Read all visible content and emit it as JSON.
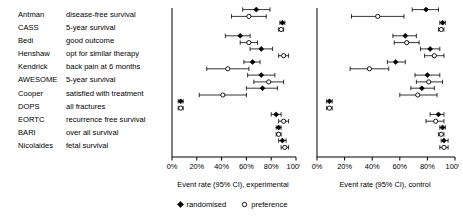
{
  "figure": {
    "legend": [
      {
        "marker": "filled-diamond-icon",
        "label": "randomised"
      },
      {
        "marker": "open-circle-icon",
        "label": "preference"
      }
    ]
  },
  "studies": [
    {
      "name": "Antman",
      "outcome": "disease-free survival"
    },
    {
      "name": "CASS",
      "outcome": "5-year survival"
    },
    {
      "name": "Bedi",
      "outcome": "good outcome"
    },
    {
      "name": "Henshaw",
      "outcome": "opt for similar therapy"
    },
    {
      "name": "Kendrick",
      "outcome": "back pain at 6 months"
    },
    {
      "name": "AWESOME",
      "outcome": "5-year survival"
    },
    {
      "name": "Cooper",
      "outcome": "satisfied with treatment"
    },
    {
      "name": "DOPS",
      "outcome": "all fractures"
    },
    {
      "name": "EORTC",
      "outcome": "recurrence free survival"
    },
    {
      "name": "BARI",
      "outcome": "over all survival"
    },
    {
      "name": "Nicolaides",
      "outcome": "fetal survival"
    }
  ],
  "chart_data": [
    {
      "type": "forest",
      "panel": "experimental",
      "title": "",
      "xlabel": "Event rate (95% CI), experimental",
      "ylabel": "",
      "xlim": [
        0,
        100
      ],
      "xticks": [
        0,
        20,
        40,
        60,
        80,
        100
      ],
      "xticklabels": [
        "0%",
        "20%",
        "40%",
        "60%",
        "80%",
        "100%"
      ],
      "grid": false,
      "categories": [
        "Antman",
        "CASS",
        "Bedi",
        "Henshaw",
        "Kendrick",
        "AWESOME",
        "Cooper",
        "DOPS",
        "EORTC",
        "BARI",
        "Nicolaides"
      ],
      "series": [
        {
          "name": "randomised",
          "marker": "filled-diamond",
          "values": [
            68,
            89,
            55,
            72,
            65,
            72,
            73,
            7,
            84,
            86,
            89
          ],
          "ci_low": [
            57,
            87,
            43,
            63,
            58,
            61,
            60,
            5,
            80,
            84,
            86
          ],
          "ci_high": [
            79,
            91,
            63,
            81,
            71,
            83,
            85,
            9,
            88,
            88,
            92
          ]
        },
        {
          "name": "preference",
          "marker": "open-circle",
          "values": [
            62,
            88,
            62,
            90,
            45,
            78,
            41,
            7,
            90,
            86,
            91
          ],
          "ci_low": [
            48,
            86,
            55,
            86,
            28,
            66,
            22,
            5,
            86,
            84,
            88
          ],
          "ci_high": [
            76,
            90,
            69,
            94,
            62,
            90,
            60,
            9,
            94,
            88,
            94
          ]
        }
      ]
    },
    {
      "type": "forest",
      "panel": "control",
      "title": "",
      "xlabel": "Event rate (95% CI), control",
      "ylabel": "",
      "xlim": [
        0,
        100
      ],
      "xticks": [
        0,
        20,
        40,
        60,
        80,
        100
      ],
      "xticklabels": [
        "0%",
        "20%",
        "40%",
        "60%",
        "80%",
        "100%"
      ],
      "grid": false,
      "categories": [
        "Antman",
        "CASS",
        "Bedi",
        "Henshaw",
        "Kendrick",
        "AWESOME",
        "Cooper",
        "DOPS",
        "EORTC",
        "BARI",
        "Nicolaides"
      ],
      "series": [
        {
          "name": "randomised",
          "marker": "filled-diamond",
          "values": [
            79,
            91,
            64,
            82,
            57,
            80,
            76,
            9,
            88,
            91,
            92
          ],
          "ci_low": [
            69,
            89,
            55,
            75,
            51,
            71,
            68,
            7,
            82,
            89,
            90
          ],
          "ci_high": [
            88,
            93,
            72,
            89,
            64,
            89,
            85,
            11,
            92,
            93,
            95
          ]
        },
        {
          "name": "preference",
          "marker": "open-circle",
          "values": [
            44,
            90,
            65,
            85,
            38,
            81,
            73,
            9,
            86,
            90,
            92
          ],
          "ci_low": [
            25,
            88,
            56,
            78,
            24,
            72,
            60,
            7,
            79,
            88,
            89
          ],
          "ci_high": [
            63,
            92,
            74,
            92,
            52,
            91,
            87,
            11,
            92,
            92,
            95
          ]
        }
      ]
    }
  ]
}
